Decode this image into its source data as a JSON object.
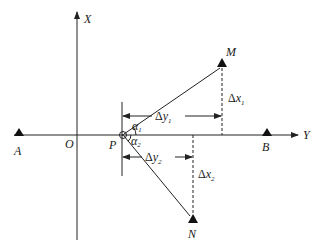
{
  "diagram": {
    "axes": {
      "x_axis_label": "X",
      "y_axis_label": "Y",
      "origin_label": "O"
    },
    "points": {
      "A": "A",
      "B": "B",
      "M": "M",
      "N": "N",
      "P": "P"
    },
    "offsets": {
      "dy1": {
        "delta": "Δ",
        "var": "y",
        "sub": "1"
      },
      "dx1": {
        "delta": "Δ",
        "var": "x",
        "sub": "1"
      },
      "dy2": {
        "delta": "Δ",
        "var": "y",
        "sub": "2"
      },
      "dx2": {
        "delta": "Δ",
        "var": "x",
        "sub": "2"
      }
    },
    "angles": {
      "a1": {
        "var": "α",
        "sub": "1"
      },
      "a2": {
        "var": "α",
        "sub": "2"
      }
    },
    "colors": {
      "stroke": "#222222",
      "marker": "#111111",
      "background": "#ffffff"
    }
  }
}
